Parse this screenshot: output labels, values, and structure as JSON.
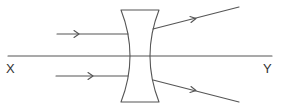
{
  "diagram": {
    "type": "ray-diagram",
    "axis": {
      "start_label": "X",
      "end_label": "Y"
    },
    "colors": {
      "line": "#555555",
      "background": "#ffffff",
      "text": "#333333"
    },
    "rays": [
      {
        "name": "incident-ray-upper",
        "direction": "left-to-right",
        "parallel_to_axis": true
      },
      {
        "name": "incident-ray-lower",
        "direction": "left-to-right",
        "parallel_to_axis": true
      },
      {
        "name": "refracted-ray-upper",
        "direction": "diverging-up"
      },
      {
        "name": "refracted-ray-lower",
        "direction": "diverging-down"
      }
    ]
  }
}
